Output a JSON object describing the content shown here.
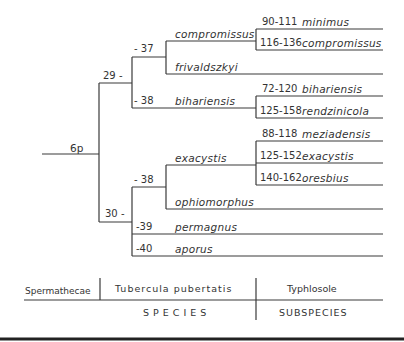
{
  "root": {
    "label": "6p"
  },
  "nodes": {
    "n29": "29 -",
    "n30": "30 -",
    "n37": "- 37",
    "n38a": "- 38",
    "n38b": "- 38",
    "n39": "-39",
    "n40": "-40"
  },
  "species": {
    "compromissus": "compromissus",
    "frivaldszkyi": "frivaldszkyi",
    "bihariensis": "bihariensis",
    "exacystis": "exacystis",
    "ophiomorphus": "ophiomorphus",
    "permagnus": "permagnus",
    "aporus": "aporus"
  },
  "subspecies": [
    {
      "range": "90-111",
      "name": "minimus"
    },
    {
      "range": "116-136",
      "name": "compromissus"
    },
    {
      "range": "72-120",
      "name": "bihariensis"
    },
    {
      "range": "125-158",
      "name": "rendzinicola"
    },
    {
      "range": "88-118",
      "name": "meziadensis"
    },
    {
      "range": "125-152",
      "name": "exacystis"
    },
    {
      "range": "140-162",
      "name": "oresbius"
    }
  ],
  "footer": {
    "spermathecae": "Spermathecae",
    "tubercula": "Tubercula  pubertatis",
    "typhlosole": "Typhlosole",
    "species_label": "SPECIES",
    "subspecies_label": "SUBSPECIES"
  }
}
